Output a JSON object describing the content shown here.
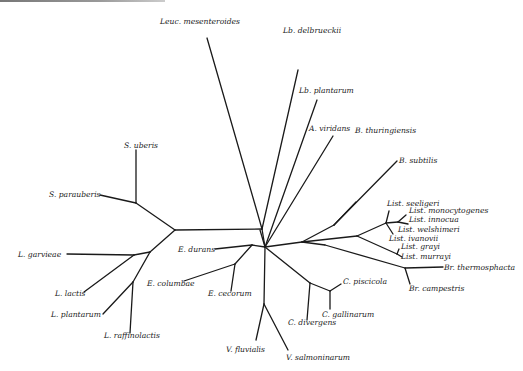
{
  "figure": {
    "type": "unrooted phylogenetic tree",
    "line_color": "#1a1a1a",
    "label_color": "#222222"
  },
  "taxa": [
    {
      "id": "leuc_mesenteroides",
      "label": "Leuc. mesenteroides"
    },
    {
      "id": "lb_delbrueckii",
      "label": "Lb. delbrueckii"
    },
    {
      "id": "lb_plantarum",
      "label": "Lb. plantarum"
    },
    {
      "id": "a_viridans",
      "label": "A. viridans"
    },
    {
      "id": "b_thuringiensis",
      "label": "B. thuringiensis"
    },
    {
      "id": "b_subtilis",
      "label": "B. subtilis"
    },
    {
      "id": "list_seeligeri",
      "label": "List. seeligeri"
    },
    {
      "id": "list_monocytogenes",
      "label": "List. monocytogenes"
    },
    {
      "id": "list_innocua",
      "label": "List. innocua"
    },
    {
      "id": "list_welshimeri",
      "label": "List. welshimeri"
    },
    {
      "id": "list_ivanovii",
      "label": "List. ivanovii"
    },
    {
      "id": "list_grayi",
      "label": "List. grayi"
    },
    {
      "id": "list_murrayi",
      "label": "List. murrayi"
    },
    {
      "id": "br_thermosphacta",
      "label": "Br. thermosphacta"
    },
    {
      "id": "br_campestris",
      "label": "Br. campestris"
    },
    {
      "id": "c_piscicola",
      "label": "C. piscicola"
    },
    {
      "id": "c_gallinarum",
      "label": "C. gallinarum"
    },
    {
      "id": "c_divergens",
      "label": "C. divergens"
    },
    {
      "id": "v_fluvialis",
      "label": "V. fluvialis"
    },
    {
      "id": "v_salmoninarum",
      "label": "V. salmoninarum"
    },
    {
      "id": "e_durans",
      "label": "E. durans"
    },
    {
      "id": "e_columbae",
      "label": "E. columbae"
    },
    {
      "id": "e_cecorum",
      "label": "E. cecorum"
    },
    {
      "id": "s_uberis",
      "label": "S. uberis"
    },
    {
      "id": "s_parauberis",
      "label": "S. parauberis"
    },
    {
      "id": "l_garvieae",
      "label": "L. garvieae"
    },
    {
      "id": "l_lactis",
      "label": "L. lactis"
    },
    {
      "id": "l_plantarum",
      "label": "L. plantarum"
    },
    {
      "id": "l_raffinolactis",
      "label": "L. raffinolactis"
    }
  ]
}
